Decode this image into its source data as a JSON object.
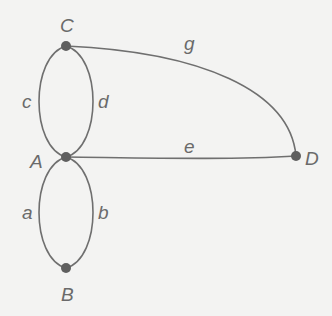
{
  "diagram": {
    "type": "multigraph",
    "colors": {
      "edge": "#6f6f6f",
      "node": "#5f5f5f",
      "label": "#6a6a6a",
      "background": "#f3f3f2"
    },
    "nodes": [
      {
        "id": "C",
        "label": "C",
        "x": 66,
        "y": 46
      },
      {
        "id": "A",
        "label": "A",
        "x": 66,
        "y": 157
      },
      {
        "id": "B",
        "label": "B",
        "x": 66,
        "y": 268
      },
      {
        "id": "D",
        "label": "D",
        "x": 296,
        "y": 156
      }
    ],
    "edges": [
      {
        "id": "a",
        "label": "a",
        "from": "A",
        "to": "B"
      },
      {
        "id": "b",
        "label": "b",
        "from": "A",
        "to": "B"
      },
      {
        "id": "c",
        "label": "c",
        "from": "A",
        "to": "C"
      },
      {
        "id": "d",
        "label": "d",
        "from": "A",
        "to": "C"
      },
      {
        "id": "e",
        "label": "e",
        "from": "A",
        "to": "D"
      },
      {
        "id": "g",
        "label": "g",
        "from": "C",
        "to": "D"
      }
    ]
  }
}
